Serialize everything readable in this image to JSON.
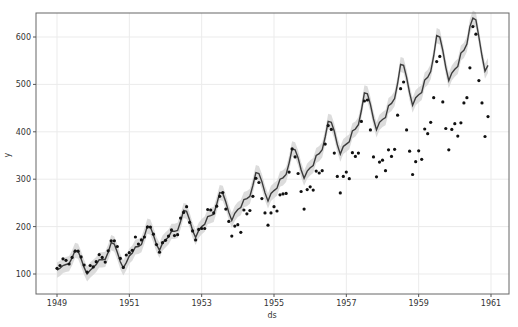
{
  "chart_data": {
    "type": "line",
    "title": "",
    "xlabel": "ds",
    "ylabel": "y",
    "x_ticks": [
      "1949",
      "1951",
      "1953",
      "1955",
      "1957",
      "1959",
      "1961"
    ],
    "y_ticks": [
      100,
      200,
      300,
      400,
      500,
      600
    ],
    "xlim": [
      1948.7,
      1961.45
    ],
    "ylim": [
      58,
      650
    ],
    "grid": true,
    "legend": null,
    "colors": {
      "points": "#111111",
      "forecast_line": "#444444",
      "uncertainty_band": "#cfcfcf",
      "grid": "#ebebeb",
      "axes": "#555555"
    },
    "series": [
      {
        "name": "observed",
        "style": "scatter",
        "start": 1949.0,
        "step": 0.0833333,
        "values": [
          112,
          118,
          132,
          129,
          121,
          135,
          148,
          148,
          136,
          119,
          104,
          118,
          115,
          126,
          141,
          135,
          125,
          149,
          170,
          170,
          158,
          133,
          114,
          140,
          145,
          150,
          178,
          163,
          172,
          178,
          199,
          199,
          184,
          162,
          146,
          166,
          171,
          180,
          193,
          181,
          183,
          218,
          230,
          242,
          209,
          191,
          172,
          194,
          196,
          196,
          236,
          235,
          229,
          243,
          264,
          272,
          237,
          211,
          180,
          201,
          204,
          188,
          235,
          227,
          234,
          264,
          302,
          293,
          259,
          229,
          203,
          229,
          242,
          233,
          267,
          269,
          270,
          315,
          364,
          347,
          312,
          274,
          237,
          278,
          284,
          277,
          317,
          313,
          318,
          374,
          413,
          405,
          355,
          306,
          271,
          306,
          315,
          301,
          356,
          348,
          355,
          422,
          465,
          467,
          404,
          347,
          305,
          336,
          340,
          318,
          362,
          348,
          363,
          435,
          491,
          505,
          404,
          359,
          310,
          337,
          360,
          342,
          406,
          396,
          420,
          472,
          548,
          559,
          463,
          407,
          362,
          405,
          417,
          391,
          419,
          461,
          472,
          535,
          622,
          606,
          508,
          461,
          390,
          432
        ]
      },
      {
        "name": "yhat",
        "style": "line",
        "start": 1949.0,
        "step": 0.0833333,
        "values": [
          108,
          112,
          118,
          120,
          122,
          134,
          150,
          148,
          132,
          114,
          100,
          108,
          114,
          120,
          130,
          130,
          131,
          146,
          166,
          163,
          146,
          126,
          113,
          124,
          138,
          144,
          157,
          158,
          162,
          180,
          201,
          199,
          182,
          162,
          150,
          165,
          172,
          178,
          190,
          190,
          192,
          211,
          234,
          232,
          214,
          192,
          177,
          192,
          200,
          205,
          221,
          223,
          226,
          247,
          272,
          270,
          252,
          230,
          213,
          228,
          236,
          240,
          257,
          259,
          264,
          287,
          314,
          312,
          295,
          271,
          254,
          270,
          276,
          281,
          300,
          303,
          310,
          334,
          364,
          362,
          345,
          320,
          302,
          317,
          324,
          329,
          350,
          354,
          362,
          389,
          422,
          420,
          401,
          373,
          353,
          369,
          374,
          379,
          402,
          406,
          415,
          445,
          482,
          480,
          458,
          427,
          404,
          420,
          426,
          430,
          455,
          460,
          470,
          502,
          542,
          540,
          515,
          482,
          456,
          472,
          478,
          483,
          509,
          515,
          527,
          560,
          603,
          600,
          572,
          536,
          508,
          524,
          532,
          538,
          566,
          572,
          585,
          622,
          640,
          636,
          600,
          560,
          528,
          540
        ]
      }
    ]
  }
}
